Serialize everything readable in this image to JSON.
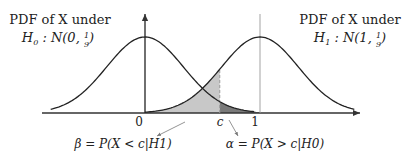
{
  "labels": {
    "h0_line1": "PDF of X under",
    "h0_line2": "H0 : N(0, 1/9)",
    "h1_line1": "PDF of X under",
    "h1_line2": "H1 : N(1, 1/9)",
    "tick_0": "0",
    "tick_c": "c",
    "tick_1": "1",
    "beta_label": "β = P(X < c|H1)",
    "alpha_label": "α = P(X > c|H0)"
  },
  "distributions": {
    "h0": {
      "mean": 0,
      "variance": 0.1111
    },
    "h1": {
      "mean": 1,
      "variance": 0.1111
    }
  },
  "threshold_c": 0.65,
  "colors": {
    "curve": "#222222",
    "beta_fill": "#c8c8c8",
    "alpha_fill": "#7a7a7a",
    "axis": "#333333",
    "dashed": "#999999",
    "pointer": "#888888"
  }
}
